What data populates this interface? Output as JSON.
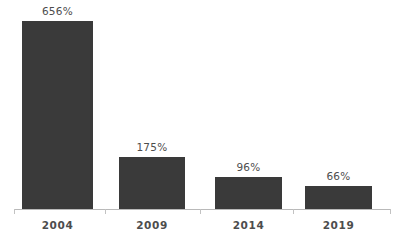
{
  "chart_data": {
    "type": "bar",
    "title": "",
    "subtitle": "",
    "xlabel": "",
    "ylabel": "",
    "categories": [
      "2004",
      "2009",
      "2014",
      "2019"
    ],
    "values": [
      656,
      175,
      96,
      66
    ],
    "value_labels": [
      "656%",
      "175%",
      "96%",
      "66%"
    ],
    "ylim": [
      0,
      656
    ],
    "grid": false,
    "legend": null,
    "legend_position": "none",
    "annotations": [],
    "colors": {
      "bar": "#3a3a3a",
      "axis": "#b9b9b9",
      "tick": "#c2c2c2",
      "label_text": "#4d4d4d",
      "background": "#ffffff"
    }
  },
  "bars": [
    {
      "category": "2004",
      "value": 656,
      "label": "656%",
      "x": 22,
      "width": 71,
      "top": 21,
      "height": 188,
      "label_x": 22,
      "label_y": 5
    },
    {
      "category": "2009",
      "value": 175,
      "label": "175%",
      "x": 119,
      "width": 66,
      "top": 157,
      "height": 52,
      "label_x": 119,
      "label_y": 141
    },
    {
      "category": "2014",
      "value": 96,
      "label": "96%",
      "x": 215,
      "width": 67,
      "top": 177,
      "height": 32,
      "label_x": 215,
      "label_y": 161
    },
    {
      "category": "2019",
      "value": 66,
      "label": "66%",
      "x": 305,
      "width": 67,
      "top": 186,
      "height": 23,
      "label_x": 305,
      "label_y": 170
    }
  ],
  "category_labels": [
    {
      "text": "2004",
      "x": 22,
      "width": 71,
      "y": 219
    },
    {
      "text": "2009",
      "x": 119,
      "width": 66,
      "y": 219
    },
    {
      "text": "2014",
      "x": 215,
      "width": 67,
      "y": 219
    },
    {
      "text": "2019",
      "x": 305,
      "width": 67,
      "y": 219
    }
  ],
  "axis": {
    "line_left": 14,
    "line_top": 209,
    "line_width": 377,
    "ticks": [
      14,
      105,
      200,
      293,
      390
    ]
  }
}
